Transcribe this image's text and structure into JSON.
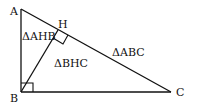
{
  "diagram": {
    "vertices": {
      "A": {
        "label": "A",
        "x": 21,
        "y": 9
      },
      "B": {
        "label": "B",
        "x": 21,
        "y": 92
      },
      "C": {
        "label": "C",
        "x": 171,
        "y": 92
      },
      "H": {
        "label": "H",
        "x": 58,
        "y": 34
      }
    },
    "triangle_labels": {
      "ahb": "ΔAHB",
      "bhc": "ΔBHC",
      "abc": "ΔABC"
    },
    "right_angles": [
      "B",
      "H"
    ],
    "stroke_color": "#111111",
    "background": "#ffffff"
  }
}
